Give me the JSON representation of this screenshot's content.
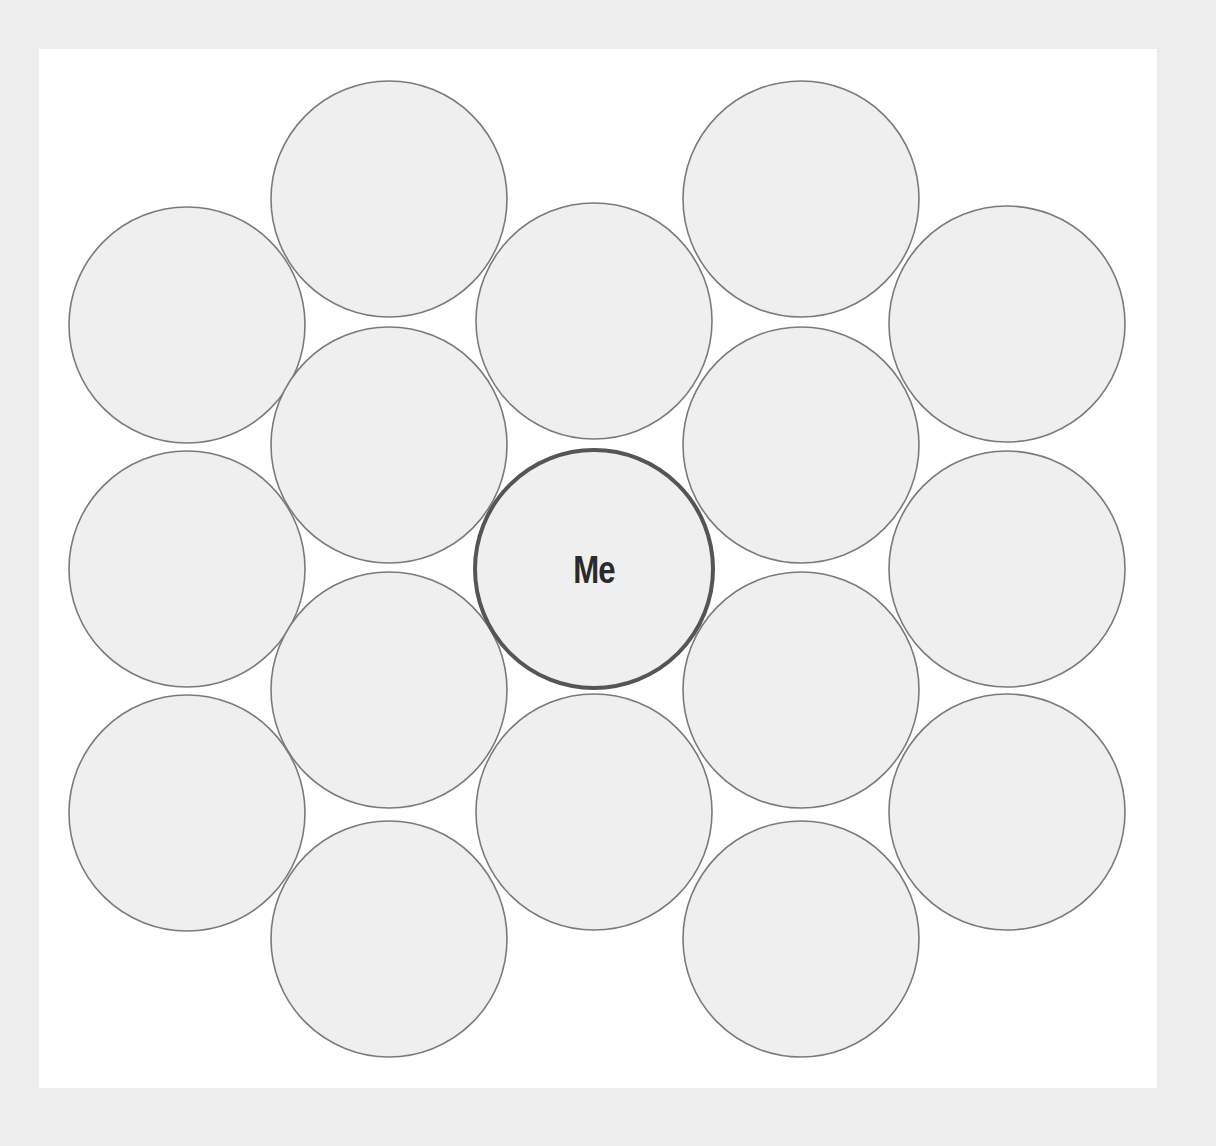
{
  "diagram": {
    "type": "circle-map",
    "center": {
      "label": "Me",
      "cx": 594,
      "cy": 569,
      "r": 119
    },
    "radius": 118,
    "colors": {
      "page_background": "#ededed",
      "panel_background": "#ffffff",
      "bubble_fill": "#efefef",
      "bubble_stroke": "#7a7a7a",
      "center_stroke": "#555555",
      "label_color": "#2a2a2a"
    },
    "bubbles": [
      {
        "id": "c2-r1",
        "cx": 389,
        "cy": 199,
        "label": ""
      },
      {
        "id": "c4-r1",
        "cx": 801,
        "cy": 199,
        "label": ""
      },
      {
        "id": "c1-r2",
        "cx": 187,
        "cy": 325,
        "label": ""
      },
      {
        "id": "c3-r2",
        "cx": 594,
        "cy": 321,
        "label": ""
      },
      {
        "id": "c5-r2",
        "cx": 1007,
        "cy": 324,
        "label": ""
      },
      {
        "id": "c2-r3",
        "cx": 389,
        "cy": 445,
        "label": ""
      },
      {
        "id": "c4-r3",
        "cx": 801,
        "cy": 445,
        "label": ""
      },
      {
        "id": "c1-r4",
        "cx": 187,
        "cy": 569,
        "label": ""
      },
      {
        "id": "c5-r4",
        "cx": 1007,
        "cy": 569,
        "label": ""
      },
      {
        "id": "c2-r5",
        "cx": 389,
        "cy": 690,
        "label": ""
      },
      {
        "id": "c4-r5",
        "cx": 801,
        "cy": 690,
        "label": ""
      },
      {
        "id": "c1-r6",
        "cx": 187,
        "cy": 813,
        "label": ""
      },
      {
        "id": "c3-r6",
        "cx": 594,
        "cy": 812,
        "label": ""
      },
      {
        "id": "c5-r6",
        "cx": 1007,
        "cy": 812,
        "label": ""
      },
      {
        "id": "c2-r7",
        "cx": 389,
        "cy": 939,
        "label": ""
      },
      {
        "id": "c4-r7",
        "cx": 801,
        "cy": 939,
        "label": ""
      }
    ]
  }
}
